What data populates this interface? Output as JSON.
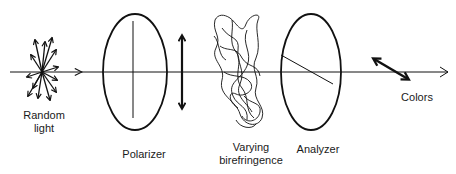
{
  "diagram": {
    "type": "optics-schematic",
    "colors": {
      "ink": "#111111",
      "background": "#ffffff"
    },
    "beam": {
      "from": [
        10,
        72
      ],
      "to": [
        448,
        72
      ],
      "direction": "left-to-right"
    },
    "components": [
      {
        "id": "random-light",
        "label_lines": [
          "Random",
          "light"
        ],
        "kind": "unpolarized-source"
      },
      {
        "id": "polarizer",
        "label_lines": [
          "Polarizer"
        ],
        "kind": "polarizer",
        "axis": "vertical"
      },
      {
        "id": "polarized-light",
        "label_lines": [],
        "kind": "vertical-double-arrow"
      },
      {
        "id": "varying-birefringence",
        "label_lines": [
          "Varying",
          "birefringence"
        ],
        "kind": "birefringent-sample"
      },
      {
        "id": "analyzer",
        "label_lines": [
          "Analyzer"
        ],
        "kind": "analyzer",
        "axis": "diagonal"
      },
      {
        "id": "colors",
        "label_lines": [
          "Colors"
        ],
        "kind": "diagonal-double-arrow"
      }
    ]
  },
  "labels": {
    "random_light_1": "Random",
    "random_light_2": "light",
    "polarizer": "Polarizer",
    "birefringence_1": "Varying",
    "birefringence_2": "birefringence",
    "analyzer": "Analyzer",
    "colors": "Colors"
  }
}
